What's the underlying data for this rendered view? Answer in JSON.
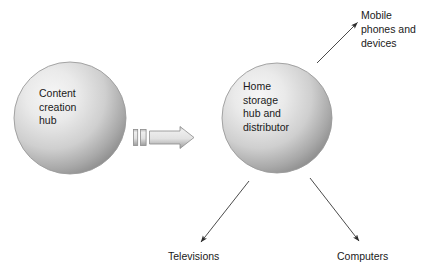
{
  "diagram": {
    "background_color": "#ffffff",
    "text_color": "#1a1a1a",
    "nodes": [
      {
        "id": "content-creation-hub",
        "label": "Content\ncreation\nhub",
        "shape": "circle",
        "cx": 70,
        "cy": 118,
        "r": 56,
        "fill_light": "#f2f2f2",
        "fill_dark": "#878787",
        "stroke": "#9b9b9b"
      },
      {
        "id": "home-storage-hub",
        "label": "Home\nstorage\nhub and\ndistributor",
        "shape": "circle",
        "cx": 277,
        "cy": 118,
        "r": 55,
        "fill_light": "#f2f2f2",
        "fill_dark": "#878787",
        "stroke": "#9b9b9b"
      }
    ],
    "endpoint_labels": [
      {
        "id": "mobile-phones-and-devices",
        "label": "Mobile\nphones and\ndevices"
      },
      {
        "id": "televisions",
        "label": "Televisions"
      },
      {
        "id": "computers",
        "label": "Computers"
      }
    ],
    "block_arrow": {
      "id": "block-arrow-content-to-storage",
      "direction": "right",
      "fill_light": "#f0f0f0",
      "fill_dark": "#9a9a9a",
      "stroke": "#8c8c8c",
      "segments": 3
    },
    "connectors": [
      {
        "id": "connector-to-mobile",
        "from": "home-storage-hub",
        "to": "mobile-phones-and-devices",
        "direction": "up-right",
        "color": "#2b2b2b"
      },
      {
        "id": "connector-to-televisions",
        "from": "home-storage-hub",
        "to": "televisions",
        "direction": "down-left",
        "color": "#2b2b2b"
      },
      {
        "id": "connector-to-computers",
        "from": "home-storage-hub",
        "to": "computers",
        "direction": "down-right",
        "color": "#2b2b2b"
      }
    ]
  }
}
